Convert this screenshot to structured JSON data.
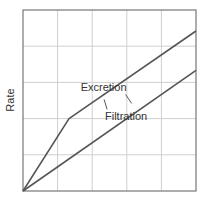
{
  "chart_data": {
    "type": "line",
    "title": "",
    "xlabel": "",
    "ylabel": "Rate",
    "xlim": [
      0,
      5
    ],
    "ylim": [
      0,
      5
    ],
    "grid": true,
    "x_divisions": 5,
    "y_divisions": 5,
    "legend": "none",
    "series": [
      {
        "name": "Excretion",
        "points": [
          [
            0,
            0
          ],
          [
            1.33,
            2.0
          ],
          [
            5,
            4.42
          ]
        ],
        "label_anchor": [
          2.33,
          2.75
        ]
      },
      {
        "name": "Filtration",
        "points": [
          [
            0,
            0
          ],
          [
            5,
            3.33
          ]
        ],
        "label_anchor": [
          2.98,
          1.95
        ]
      }
    ]
  },
  "colors": {
    "series": "#555555",
    "grid": "#cfcfcf",
    "axis": "#777777"
  }
}
